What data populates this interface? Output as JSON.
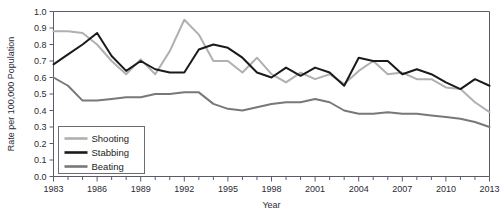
{
  "chart_data": {
    "type": "line",
    "title": "",
    "xlabel": "Year",
    "ylabel": "Rate per 100,000 Population",
    "xlim": [
      1983,
      2013
    ],
    "ylim": [
      0.0,
      1.0
    ],
    "grid": false,
    "legend_position": "bottom-left",
    "x_tick_labels": [
      "1983",
      "1986",
      "1989",
      "1992",
      "1995",
      "1998",
      "2001",
      "2004",
      "2007",
      "2010",
      "2013"
    ],
    "x_tick_label_years": [
      1983,
      1986,
      1989,
      1992,
      1995,
      1998,
      2001,
      2004,
      2007,
      2010,
      2013
    ],
    "x_minor_tick_interval": 1,
    "y_tick_labels": [
      "0.0",
      "0.1",
      "0.2",
      "0.3",
      "0.4",
      "0.5",
      "0.6",
      "0.7",
      "0.8",
      "0.9",
      "1.0"
    ],
    "y_tick_values": [
      0.0,
      0.1,
      0.2,
      0.3,
      0.4,
      0.5,
      0.6,
      0.7,
      0.8,
      0.9,
      1.0
    ],
    "x": [
      1983,
      1984,
      1985,
      1986,
      1987,
      1988,
      1989,
      1990,
      1991,
      1992,
      1993,
      1994,
      1995,
      1996,
      1997,
      1998,
      1999,
      2000,
      2001,
      2002,
      2003,
      2004,
      2005,
      2006,
      2007,
      2008,
      2009,
      2010,
      2011,
      2012,
      2013
    ],
    "series": [
      {
        "name": "Shooting",
        "color": "#b0b0b0",
        "values": [
          0.88,
          0.88,
          0.87,
          0.8,
          0.7,
          0.62,
          0.71,
          0.62,
          0.76,
          0.95,
          0.86,
          0.7,
          0.7,
          0.63,
          0.72,
          0.62,
          0.57,
          0.63,
          0.59,
          0.62,
          0.56,
          0.64,
          0.7,
          0.62,
          0.63,
          0.59,
          0.59,
          0.54,
          0.53,
          0.45,
          0.39
        ]
      },
      {
        "name": "Stabbing",
        "color": "#1a1a1a",
        "values": [
          0.68,
          0.74,
          0.8,
          0.87,
          0.73,
          0.64,
          0.7,
          0.65,
          0.63,
          0.63,
          0.77,
          0.8,
          0.78,
          0.72,
          0.63,
          0.6,
          0.66,
          0.61,
          0.66,
          0.63,
          0.55,
          0.72,
          0.7,
          0.7,
          0.62,
          0.65,
          0.62,
          0.57,
          0.53,
          0.59,
          0.55
        ]
      },
      {
        "name": "Beating",
        "color": "#787878",
        "values": [
          0.6,
          0.55,
          0.46,
          0.46,
          0.47,
          0.48,
          0.48,
          0.5,
          0.5,
          0.51,
          0.51,
          0.44,
          0.41,
          0.4,
          0.42,
          0.44,
          0.45,
          0.45,
          0.47,
          0.45,
          0.4,
          0.38,
          0.38,
          0.39,
          0.38,
          0.38,
          0.37,
          0.36,
          0.35,
          0.33,
          0.3
        ]
      }
    ]
  },
  "legend": {
    "items": [
      {
        "label": "Shooting"
      },
      {
        "label": "Stabbing"
      },
      {
        "label": "Beating"
      }
    ]
  }
}
